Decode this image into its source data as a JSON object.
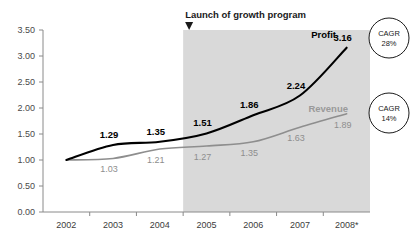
{
  "chart_data": {
    "type": "line",
    "title": "",
    "xlabel": "",
    "ylabel": "",
    "categories": [
      "2002",
      "2003",
      "2004",
      "2005",
      "2006",
      "2007",
      "2008*"
    ],
    "ylim": [
      0.0,
      3.5
    ],
    "yticks": [
      "0.00",
      "0.50",
      "1.00",
      "1.50",
      "2.00",
      "2.50",
      "3.00",
      "3.50"
    ],
    "grid": false,
    "legend_position": "inline-end-of-line",
    "series": [
      {
        "name": "Profit",
        "color": "#000000",
        "values": [
          1.0,
          1.29,
          1.35,
          1.51,
          1.86,
          2.24,
          3.16
        ],
        "labels": [
          "",
          "1.29",
          "1.35",
          "1.51",
          "1.86",
          "2.24",
          "3.16"
        ],
        "cagr": "28%"
      },
      {
        "name": "Revenue",
        "color": "#8e8e8e",
        "values": [
          1.0,
          1.03,
          1.21,
          1.27,
          1.35,
          1.63,
          1.89
        ],
        "labels": [
          "",
          "1.03",
          "1.21",
          "1.27",
          "1.35",
          "1.63",
          "1.89"
        ],
        "cagr": "14%"
      }
    ],
    "annotations": [
      {
        "text": "Launch of growth program",
        "marker": "down-triangle-marker",
        "at_category": "2005",
        "shaded_region_from": "2005",
        "shaded_region_color": "#d9d9d9"
      }
    ],
    "badges": [
      {
        "label": "CAGR",
        "value": "28%",
        "series": "Profit"
      },
      {
        "label": "CAGR",
        "value": "14%",
        "series": "Revenue"
      }
    ]
  }
}
